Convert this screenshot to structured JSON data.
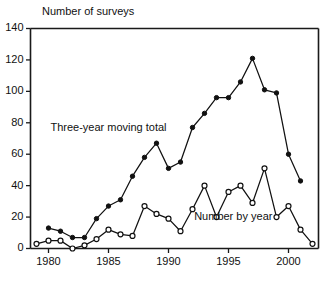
{
  "chart_data": {
    "type": "line",
    "title": "",
    "axis_title_top_left": "Number of surveys",
    "xlabel": "",
    "ylabel": "Number of surveys",
    "xlim": [
      1978.5,
      2002.5
    ],
    "ylim": [
      0,
      140
    ],
    "ytick_values": [
      0,
      20,
      40,
      60,
      80,
      100,
      120,
      140
    ],
    "ytick_labels": [
      "0",
      "20",
      "40",
      "60",
      "80",
      "100",
      "120",
      "140"
    ],
    "xtick_values": [
      1980,
      1985,
      1990,
      1995,
      2000
    ],
    "xtick_labels": [
      "1980",
      "1985",
      "1990",
      "1995",
      "2000"
    ],
    "grid": false,
    "legend": "inline-annotations",
    "x": [
      1979,
      1980,
      1981,
      1982,
      1983,
      1984,
      1985,
      1986,
      1987,
      1988,
      1989,
      1990,
      1991,
      1992,
      1993,
      1994,
      1995,
      1996,
      1997,
      1998,
      1999,
      2000,
      2001,
      2002
    ],
    "series": [
      {
        "name": "Three-year moving total",
        "marker": "filled-circle",
        "x": [
          1980,
          1981,
          1982,
          1983,
          1984,
          1985,
          1986,
          1987,
          1988,
          1989,
          1990,
          1991,
          1992,
          1993,
          1994,
          1995,
          1996,
          1997,
          1998,
          1999,
          2000,
          2001
        ],
        "values": [
          13,
          11,
          7,
          7,
          19,
          27,
          31,
          46,
          58,
          67,
          51,
          55,
          77,
          86,
          96,
          96,
          106,
          121,
          101,
          99,
          60,
          43
        ]
      },
      {
        "name": "Number by year",
        "marker": "open-circle",
        "x": [
          1979,
          1980,
          1981,
          1982,
          1983,
          1984,
          1985,
          1986,
          1987,
          1988,
          1989,
          1990,
          1991,
          1992,
          1993,
          1994,
          1995,
          1996,
          1997,
          1998,
          1999,
          2000,
          2001,
          2002
        ],
        "values": [
          3,
          5,
          5,
          0,
          2,
          6,
          12,
          9,
          8,
          27,
          22,
          19,
          11,
          25,
          40,
          20,
          36,
          40,
          29,
          51,
          20,
          27,
          12,
          3
        ]
      }
    ],
    "annotations": [
      {
        "text": "Three-year moving total",
        "x": 1985.0,
        "y": 75
      },
      {
        "text": "Number by year",
        "x": 1995.4,
        "y": 18
      }
    ],
    "colors": {
      "line": "#111111",
      "marker_fill": "#111111",
      "marker_open_fill": "#ffffff",
      "axis": "#1a1a1a",
      "background": "#ffffff"
    }
  }
}
